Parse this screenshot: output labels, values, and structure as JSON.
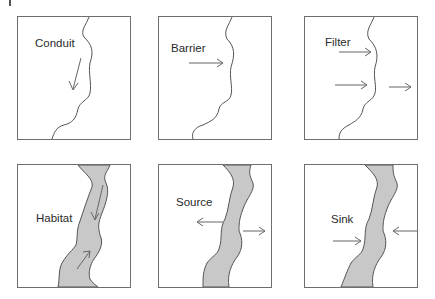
{
  "figure": {
    "panels": [
      {
        "id": "conduit",
        "label": "Conduit",
        "row": 0,
        "col": 0,
        "banks": "line",
        "arrows": [
          "along-stream"
        ]
      },
      {
        "id": "barrier",
        "label": "Barrier",
        "row": 0,
        "col": 1,
        "banks": "line",
        "arrows": [
          "toward-stream-stopped"
        ]
      },
      {
        "id": "filter",
        "label": "Filter",
        "row": 0,
        "col": 2,
        "banks": "line",
        "arrows": [
          "toward-stream-stopped",
          "toward-stream",
          "through-stream"
        ]
      },
      {
        "id": "habitat",
        "label": "Habitat",
        "row": 1,
        "col": 0,
        "banks": "shaded-corridor",
        "arrows": [
          "down-corridor",
          "up-corridor"
        ]
      },
      {
        "id": "source",
        "label": "Source",
        "row": 1,
        "col": 1,
        "banks": "shaded-corridor",
        "arrows": [
          "out-left",
          "out-right"
        ]
      },
      {
        "id": "sink",
        "label": "Sink",
        "row": 1,
        "col": 2,
        "banks": "shaded-corridor",
        "arrows": [
          "in-from-left",
          "in-from-right"
        ]
      }
    ]
  },
  "colors": {
    "border": "#6e6e6e",
    "line": "#555555",
    "arrow": "#666666",
    "corridor_fill": "#c8c8c8",
    "text": "#2a2a2a"
  }
}
